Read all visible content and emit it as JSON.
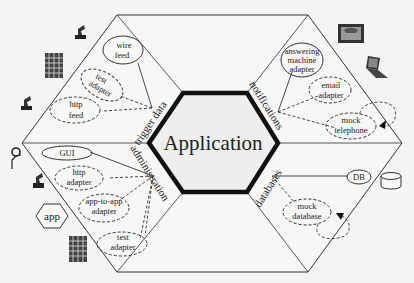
{
  "diagram": {
    "center": {
      "label": "Application"
    },
    "ports": {
      "trigger_data": "trigger data",
      "notifications": "notifications",
      "administration": "administration",
      "databases": "databases"
    },
    "adapters": {
      "trigger_data": {
        "wire_feed": [
          "wire",
          "feed"
        ],
        "test_adapter": [
          "test",
          "adapter"
        ],
        "http_feed": [
          "http",
          "feed"
        ]
      },
      "notifications": {
        "answering_machine_adapter": [
          "answering",
          "machine",
          "adapter"
        ],
        "email_adapter": [
          "email",
          "adapter"
        ],
        "mock_telephone": [
          "mock",
          "telephone"
        ]
      },
      "administration": {
        "gui": "GUI",
        "http_adapter": [
          "http",
          "adapter"
        ],
        "app_to_app_adapter": [
          "app-to-app",
          "adapter"
        ],
        "test_adapter": [
          "test",
          "adapter"
        ]
      },
      "databases": {
        "db": "DB",
        "mock_database": [
          "mock",
          "database"
        ]
      }
    },
    "actors": {
      "app_label": "app"
    },
    "icons": [
      "person-icon",
      "building-icon",
      "person-icon",
      "telephone-icon",
      "laptop-icon",
      "user-icon",
      "person-icon",
      "app-hexagon-icon",
      "building-icon",
      "database-cylinder-icon"
    ]
  }
}
